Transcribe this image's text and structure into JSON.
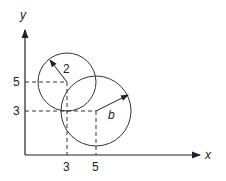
{
  "diagram": {
    "axes": {
      "x_label": "x",
      "y_label": "y"
    },
    "x_ticks": [
      "3",
      "5"
    ],
    "y_ticks": [
      "5",
      "3"
    ],
    "circle_small": {
      "center": [
        3,
        5
      ],
      "radius_label": "2"
    },
    "circle_large": {
      "center": [
        5,
        3
      ],
      "radius_label": "b"
    }
  }
}
